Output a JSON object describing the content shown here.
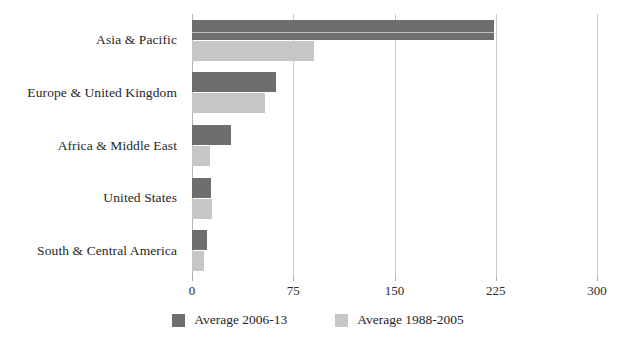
{
  "chart_data": {
    "type": "bar",
    "orientation": "horizontal",
    "title": "",
    "xlabel": "",
    "ylabel": "",
    "xlim": [
      0,
      300
    ],
    "xticks": [
      0,
      75,
      150,
      225,
      300
    ],
    "grid": "vertical",
    "legend_position": "bottom-center",
    "categories": [
      "Asia & Pacific",
      "Europe & United Kingdom",
      "Africa & Middle East",
      "United States",
      "South & Central America"
    ],
    "series": [
      {
        "name": "Average 2006-13",
        "color": "#6e6e6e",
        "values": [
          224,
          62,
          29,
          14,
          11
        ]
      },
      {
        "name": "Average 1988-2005",
        "color": "#c6c6c6",
        "values": [
          90,
          54,
          13,
          15,
          9
        ]
      }
    ]
  },
  "axis": {
    "tick_labels": [
      "0",
      "75",
      "150",
      "225",
      "300"
    ]
  },
  "legend": {
    "items": [
      {
        "label": "Average 2006-13",
        "color": "#6e6e6e"
      },
      {
        "label": "Average 1988-2005",
        "color": "#c6c6c6"
      }
    ]
  }
}
